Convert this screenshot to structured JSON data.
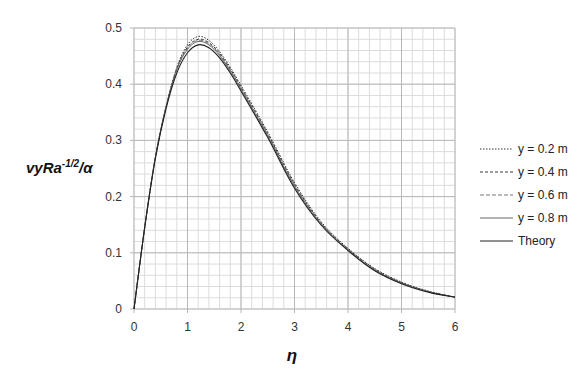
{
  "chart_data": {
    "type": "line",
    "title": "",
    "xlabel": "η",
    "ylabel": "vyRa^-1/2/α",
    "ylabel_parts": {
      "base": "vyRa",
      "sup": "-1/2",
      "tail": "/α"
    },
    "xlim": [
      0,
      6
    ],
    "ylim": [
      0,
      0.5
    ],
    "x_ticks": [
      "0",
      "1",
      "2",
      "3",
      "4",
      "5",
      "6"
    ],
    "y_ticks": [
      "0",
      "0.1",
      "0.2",
      "0.3",
      "0.4",
      "0.5"
    ],
    "grid": {
      "major": true,
      "minor": true,
      "x_minor_step": 0.2,
      "y_minor_step": 0.02
    },
    "legend_position": "right",
    "x": [
      0,
      0.2,
      0.4,
      0.6,
      0.8,
      1.0,
      1.2,
      1.4,
      1.6,
      1.8,
      2.0,
      2.5,
      3.0,
      3.5,
      4.0,
      4.5,
      5.0,
      5.5,
      6.0
    ],
    "series": [
      {
        "name": "y = 0.2 m",
        "style": "dotted",
        "values": [
          0,
          0.145,
          0.27,
          0.36,
          0.43,
          0.47,
          0.485,
          0.478,
          0.458,
          0.43,
          0.398,
          0.315,
          0.225,
          0.155,
          0.108,
          0.072,
          0.048,
          0.032,
          0.021
        ]
      },
      {
        "name": "y = 0.4 m",
        "style": "dashed-fine",
        "values": [
          0,
          0.145,
          0.27,
          0.36,
          0.428,
          0.466,
          0.48,
          0.474,
          0.455,
          0.427,
          0.395,
          0.312,
          0.222,
          0.153,
          0.107,
          0.071,
          0.047,
          0.031,
          0.021
        ]
      },
      {
        "name": "y = 0.6 m",
        "style": "dashed",
        "values": [
          0,
          0.145,
          0.27,
          0.36,
          0.427,
          0.464,
          0.478,
          0.472,
          0.453,
          0.425,
          0.393,
          0.31,
          0.22,
          0.152,
          0.106,
          0.07,
          0.047,
          0.031,
          0.021
        ]
      },
      {
        "name": "y = 0.8 m",
        "style": "solid-gray",
        "values": [
          0,
          0.145,
          0.27,
          0.36,
          0.426,
          0.462,
          0.476,
          0.47,
          0.451,
          0.423,
          0.391,
          0.308,
          0.218,
          0.151,
          0.105,
          0.069,
          0.046,
          0.031,
          0.021
        ]
      },
      {
        "name": "Theory",
        "style": "solid",
        "values": [
          0,
          0.145,
          0.268,
          0.357,
          0.42,
          0.456,
          0.47,
          0.465,
          0.447,
          0.42,
          0.388,
          0.305,
          0.215,
          0.149,
          0.104,
          0.068,
          0.045,
          0.03,
          0.021
        ]
      }
    ]
  },
  "legend": {
    "items": [
      {
        "label": "y = 0.2 m"
      },
      {
        "label": "y = 0.4 m"
      },
      {
        "label": "y = 0.6 m"
      },
      {
        "label": "y = 0.8 m"
      },
      {
        "label": "Theory"
      }
    ]
  },
  "colors": {
    "grid_major": "#b8b8b8",
    "grid_minor": "#dcdcdc",
    "line": "#222222",
    "line_gray": "#666666"
  }
}
